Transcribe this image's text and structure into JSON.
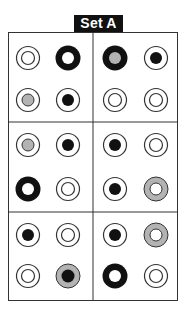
{
  "title": "Set A",
  "colors": {
    "black": "#111111",
    "gray": "#b3b3b3",
    "white": "#ffffff",
    "line": "#333333"
  },
  "layout": {
    "columns_x": [
      28,
      68,
      115,
      156
    ],
    "rows_y": [
      58,
      100,
      145,
      189,
      235,
      276
    ],
    "panels": "3 rows x 2 columns, each panel holds 2x2 circles"
  },
  "circle_types": {
    "plain": "thin outer ring, thin inner ring, white center",
    "dot": "thin outer ring, black filled center",
    "gray-dot": "thin outer ring, gray filled center",
    "thick-black": "thick black ring, white center",
    "thick-black-gray": "thick black ring, gray center",
    "thick-gray": "thick gray ring, white center",
    "thick-gray-dot": "thick gray ring, black center"
  },
  "grid": [
    [
      "plain",
      "thick-black",
      "thick-black-gray",
      "dot"
    ],
    [
      "gray-dot",
      "dot",
      "plain",
      "plain"
    ],
    [
      "gray-dot",
      "dot",
      "dot",
      "plain"
    ],
    [
      "thick-black",
      "plain",
      "dot",
      "thick-gray"
    ],
    [
      "dot",
      "plain",
      "dot",
      "thick-gray"
    ],
    [
      "plain",
      "thick-gray-dot",
      "thick-black",
      "plain"
    ]
  ]
}
